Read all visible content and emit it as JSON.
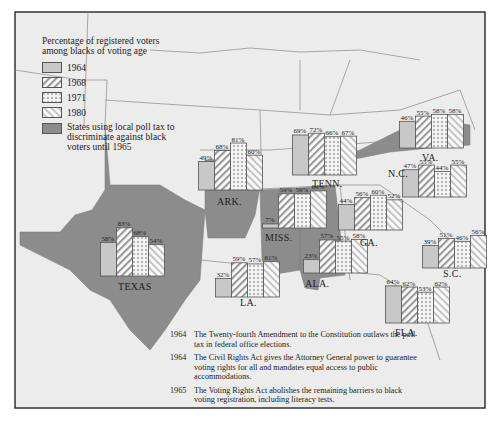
{
  "legend": {
    "title_line1": "Percentage of registered voters",
    "title_line2": "among blacks of voting age",
    "items": [
      {
        "label": "1964",
        "pattern": "solid-light"
      },
      {
        "label": "1968",
        "pattern": "diagonal-stripes"
      },
      {
        "label": "1971",
        "pattern": "dots"
      },
      {
        "label": "1980",
        "pattern": "light-diagonal"
      }
    ],
    "poll_tax_label": "States using local poll tax to discriminate against black voters until 1965"
  },
  "colors": {
    "map_background": "#ececec",
    "poll_tax_states": "#8c8c8c",
    "bar_1964": "#c8c8c8",
    "border": "#555555"
  },
  "chart_data": {
    "type": "bar",
    "title": "Percentage of registered voters among blacks of voting age",
    "years": [
      "1964",
      "1968",
      "1971",
      "1980"
    ],
    "states": [
      {
        "name": "TEXAS",
        "values": [
          58,
          83,
          68,
          54
        ],
        "poll_tax": true
      },
      {
        "name": "ARK.",
        "values": [
          49,
          68,
          81,
          60
        ],
        "poll_tax": true
      },
      {
        "name": "TENN.",
        "values": [
          69,
          72,
          66,
          67
        ],
        "poll_tax": false
      },
      {
        "name": "VA.",
        "values": [
          46,
          55,
          58,
          58
        ],
        "poll_tax": true
      },
      {
        "name": "N.C.",
        "values": [
          47,
          55,
          44,
          55
        ],
        "poll_tax": false
      },
      {
        "name": "MISS.",
        "values": [
          7,
          59,
          59,
          64
        ],
        "poll_tax": true
      },
      {
        "name": "ALA.",
        "values": [
          23,
          57,
          55,
          58
        ],
        "poll_tax": true
      },
      {
        "name": "GA.",
        "values": [
          44,
          56,
          60,
          52
        ],
        "poll_tax": false
      },
      {
        "name": "LA.",
        "values": [
          32,
          59,
          57,
          61
        ],
        "poll_tax": false
      },
      {
        "name": "S.C.",
        "values": [
          39,
          51,
          46,
          56
        ],
        "poll_tax": false
      },
      {
        "name": "FLA.",
        "values": [
          64,
          62,
          53,
          62
        ],
        "poll_tax": false
      }
    ],
    "ylim": [
      0,
      100
    ]
  },
  "notes": [
    {
      "year": "1964",
      "text": "The Twenty-fourth Amendment to the Constitution outlaws the poll tax in federal office elections."
    },
    {
      "year": "1964",
      "text": "The Civil Rights Act gives the Attorney General power to guarantee voting rights for all and mandates equal access to public accommodations."
    },
    {
      "year": "1965",
      "text": "The Voting Rights Act abolishes the remaining barriers to black voting registration, including literacy tests."
    }
  ]
}
